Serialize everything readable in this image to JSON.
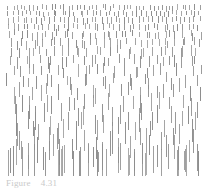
{
  "figure": {
    "caption_label": "Figure",
    "caption_number": "4.31",
    "caption_text": "Figure 4.31",
    "background_color": "#ffffff",
    "tick_color": "#8d8d8d",
    "width": 207,
    "height": 188
  },
  "chart_data": {
    "type": "scatter",
    "subtitle": "",
    "xlabel": "",
    "ylabel": "",
    "xlim": [
      0,
      207
    ],
    "ylim": [
      0,
      178
    ],
    "grid": false,
    "legend": null,
    "mark": "vertical-line-segment",
    "mark_width_px": 1,
    "mark_color": "#8d8d8d",
    "gradient": {
      "axis": "y",
      "top_row_length_px": 5,
      "bottom_row_length_px": 27,
      "top_row_count": 46,
      "bottom_row_count": 9,
      "row_count": 22
    },
    "rows": [
      {
        "y": 5,
        "length": 5,
        "count": 46,
        "jitter": 1
      },
      {
        "y": 11,
        "length": 5,
        "count": 44,
        "jitter": 1
      },
      {
        "y": 17,
        "length": 6,
        "count": 42,
        "jitter": 1
      },
      {
        "y": 24,
        "length": 6,
        "count": 39,
        "jitter": 1
      },
      {
        "y": 31,
        "length": 7,
        "count": 36,
        "jitter": 2
      },
      {
        "y": 39,
        "length": 8,
        "count": 33,
        "jitter": 2
      },
      {
        "y": 47,
        "length": 9,
        "count": 30,
        "jitter": 2
      },
      {
        "y": 56,
        "length": 10,
        "count": 27,
        "jitter": 2
      },
      {
        "y": 65,
        "length": 11,
        "count": 24,
        "jitter": 3
      },
      {
        "y": 75,
        "length": 12,
        "count": 22,
        "jitter": 3
      },
      {
        "y": 85,
        "length": 14,
        "count": 20,
        "jitter": 3
      },
      {
        "y": 95,
        "length": 15,
        "count": 18,
        "jitter": 3
      },
      {
        "y": 105,
        "length": 16,
        "count": 16,
        "jitter": 4
      },
      {
        "y": 114,
        "length": 18,
        "count": 15,
        "jitter": 4
      },
      {
        "y": 122,
        "length": 19,
        "count": 14,
        "jitter": 4
      },
      {
        "y": 130,
        "length": 20,
        "count": 13,
        "jitter": 4
      },
      {
        "y": 137,
        "length": 22,
        "count": 12,
        "jitter": 5
      },
      {
        "y": 143,
        "length": 23,
        "count": 11,
        "jitter": 5
      },
      {
        "y": 148,
        "length": 24,
        "count": 10,
        "jitter": 5
      },
      {
        "y": 152,
        "length": 25,
        "count": 10,
        "jitter": 5
      },
      {
        "y": 156,
        "length": 26,
        "count": 9,
        "jitter": 6
      },
      {
        "y": 160,
        "length": 27,
        "count": 9,
        "jitter": 6
      }
    ],
    "field_bounds": {
      "x_min": 6,
      "x_max": 201,
      "y_min": 5,
      "y_max": 176
    }
  }
}
